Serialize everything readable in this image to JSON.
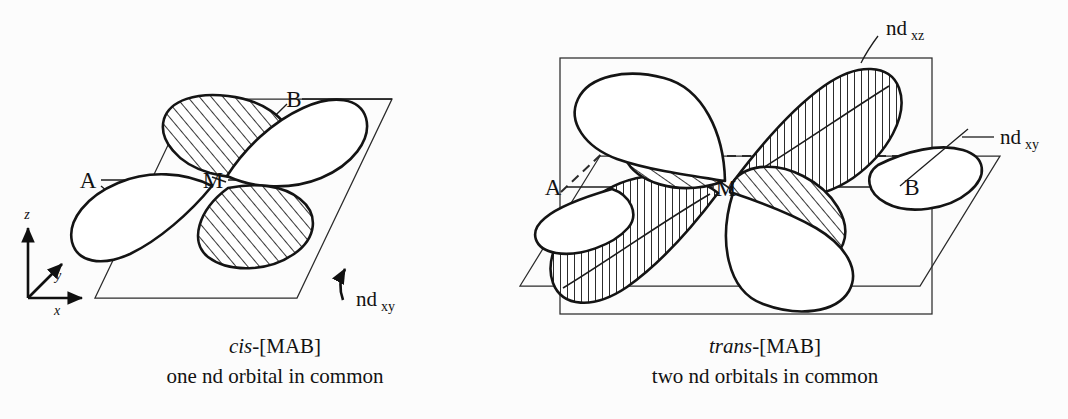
{
  "figure": {
    "background_color": "#fcfcfc",
    "ink_color": "#141414",
    "panels": [
      {
        "id": "cis",
        "caption_title_italic": "cis",
        "caption_title_rest": "-[MAB]",
        "caption_subtitle": "one nd orbital in common",
        "plane_shape": "parallelogram",
        "plane_meaning": "xy-plane containing M, A and B ligands",
        "vertex_labels": [
          "A",
          "M",
          "B"
        ],
        "orbital_labels": [
          {
            "text": "nd",
            "subscript": "xy",
            "pointer": "curved-arrow"
          }
        ],
        "coordinate_axes": [
          {
            "label": "z",
            "direction": "up"
          },
          {
            "label": "y",
            "direction": "diagonal-up-right"
          },
          {
            "label": "x",
            "direction": "right"
          }
        ],
        "lobe_count": 4,
        "shaded_lobes": 2,
        "open_lobes": 2,
        "hatch_style": "diagonal"
      },
      {
        "id": "trans",
        "caption_title_italic": "trans",
        "caption_title_rest": "-[MAB]",
        "caption_subtitle": "two nd orbitals in common",
        "plane_shape": "rectangle-plus-parallelogram",
        "plane_meaning": "xz-plane rectangle with xy-plane parallelogram overlaid",
        "vertex_labels": [
          "A",
          "M",
          "B"
        ],
        "orbital_labels": [
          {
            "text": "nd",
            "subscript": "xz",
            "pointer": "short-line"
          },
          {
            "text": "nd",
            "subscript": "xy",
            "pointer": "short-line"
          }
        ],
        "coordinate_axes": [],
        "lobe_count": 8,
        "shaded_lobes": 4,
        "open_lobes": 4,
        "hatch_style": "diagonal-and-vertical"
      }
    ]
  },
  "labels": {
    "A": "A",
    "M": "M",
    "B": "B",
    "nd": "nd",
    "sub_xy": "xy",
    "sub_xz": "xz",
    "axis_x": "x",
    "axis_y": "y",
    "axis_z": "z"
  },
  "captions": {
    "left_title_italic": "cis",
    "left_title_rest": "-[MAB]",
    "left_subtitle": "one nd orbital in common",
    "right_title_italic": "trans",
    "right_title_rest": "-[MAB]",
    "right_subtitle": "two nd orbitals in common"
  }
}
